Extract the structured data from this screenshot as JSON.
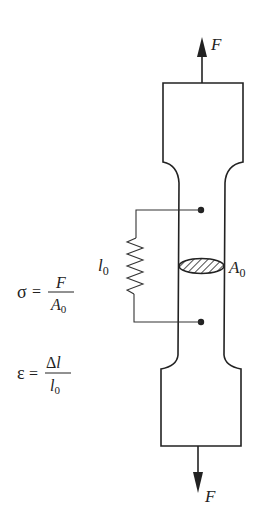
{
  "diagram": {
    "force_top": {
      "symbol": "F",
      "direction": "up"
    },
    "force_bottom": {
      "symbol": "F",
      "direction": "down"
    },
    "gauge_length": {
      "symbol": "l",
      "subscript": "0"
    },
    "cross_section": {
      "symbol": "A",
      "subscript": "0"
    },
    "stress_formula": {
      "lhs": "σ",
      "eq": "=",
      "numerator": "F",
      "denominator_symbol": "A",
      "denominator_subscript": "0"
    },
    "strain_formula": {
      "lhs": "ε",
      "eq": "=",
      "numerator": "Δl",
      "numerator_delta": "Δ",
      "numerator_symbol": "l",
      "denominator_symbol": "l",
      "denominator_subscript": "0"
    }
  }
}
